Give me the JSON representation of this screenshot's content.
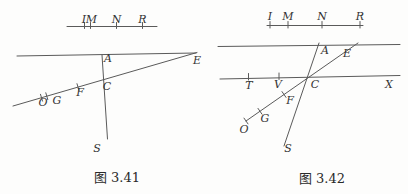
{
  "colors": {
    "background": "#fdfdfc",
    "line_ink": "#5a5a5a",
    "text_ink": "#333333"
  },
  "fig1": {
    "caption": "图 3.41",
    "ruler": {
      "i": "I",
      "m": "M",
      "n": "N",
      "r": "R"
    },
    "points": {
      "a": "A",
      "c": "C",
      "e": "E",
      "f": "F",
      "g": "G",
      "o": "O",
      "s": "S"
    }
  },
  "fig2": {
    "caption": "图 3.42",
    "ruler": {
      "i": "I",
      "m": "M",
      "n": "N",
      "r": "R"
    },
    "points": {
      "a": "A",
      "c": "C",
      "e": "E",
      "t": "T",
      "v": "V",
      "x": "X",
      "f": "F",
      "g": "G",
      "o": "O",
      "s": "S"
    }
  }
}
